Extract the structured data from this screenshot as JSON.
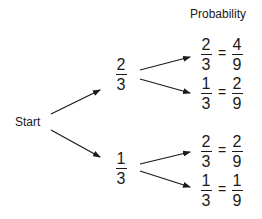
{
  "header": {
    "probability_label": "Probability"
  },
  "root": {
    "label": "Start"
  },
  "level1": [
    {
      "numerator": "2",
      "denominator": "3"
    },
    {
      "numerator": "1",
      "denominator": "3"
    }
  ],
  "outcomes": [
    {
      "branch_num": "2",
      "branch_den": "3",
      "equals": "=",
      "prob_num": "4",
      "prob_den": "9"
    },
    {
      "branch_num": "1",
      "branch_den": "3",
      "equals": "=",
      "prob_num": "2",
      "prob_den": "9"
    },
    {
      "branch_num": "2",
      "branch_den": "3",
      "equals": "=",
      "prob_num": "2",
      "prob_den": "9"
    },
    {
      "branch_num": "1",
      "branch_den": "3",
      "equals": "=",
      "prob_num": "1",
      "prob_den": "9"
    }
  ],
  "colors": {
    "ink": "#1a1a1a",
    "background": "#ffffff"
  }
}
